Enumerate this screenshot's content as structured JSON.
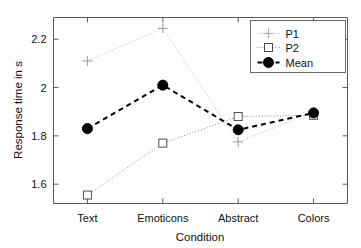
{
  "chart_data": {
    "type": "line",
    "title": "",
    "xlabel": "Condition",
    "ylabel": "Response time in s",
    "categories": [
      "Text",
      "Emoticons",
      "Abstract",
      "Colors"
    ],
    "xtick_labels": [
      "Text",
      "Emoticons",
      "Abstract",
      "Colors"
    ],
    "ytick_labels": [
      "1.6",
      "1.8",
      "2",
      "2.2"
    ],
    "ytick_values": [
      1.6,
      1.8,
      2.0,
      2.2
    ],
    "ylim": [
      1.52,
      2.29
    ],
    "xlim": [
      0.55,
      4.45
    ],
    "grid": false,
    "legend_position": "top-right",
    "series": [
      {
        "name": "P1",
        "values": [
          2.11,
          2.245,
          1.775,
          1.9
        ],
        "marker": "plus",
        "linestyle": "dotted",
        "color": "#b9b9b9"
      },
      {
        "name": "P2",
        "values": [
          1.555,
          1.77,
          1.88,
          1.885
        ],
        "marker": "open-square",
        "linestyle": "dotted",
        "color": "#8f8f8f"
      },
      {
        "name": "Mean",
        "values": [
          1.83,
          2.01,
          1.825,
          1.895
        ],
        "marker": "filled-circle",
        "linestyle": "dashed",
        "color": "#000000"
      }
    ]
  },
  "legend": {
    "entries": [
      {
        "label": "P1"
      },
      {
        "label": "P2"
      },
      {
        "label": "Mean"
      }
    ]
  },
  "axes": {
    "y_title": "Response time in s",
    "x_title": "Condition"
  },
  "icons": {
    "plus_marker": "plus-marker-icon",
    "square_marker": "open-square-marker-icon",
    "dot_marker": "filled-circle-marker-icon"
  }
}
